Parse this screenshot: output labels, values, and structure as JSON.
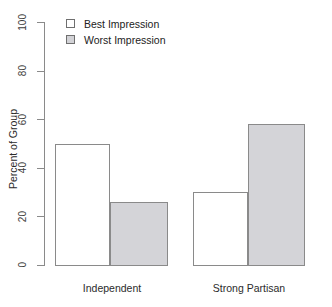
{
  "chart_data": {
    "type": "bar",
    "title": "",
    "subtitle": "",
    "xlabel": "",
    "ylabel": "Percent of Group",
    "categories": [
      "Independent",
      "Strong Partisan"
    ],
    "series": [
      {
        "name": "Best Impression",
        "values": [
          50,
          30
        ],
        "fill": "#ffffff",
        "border": "#8a8a8a"
      },
      {
        "name": "Worst Impression",
        "values": [
          26,
          58
        ],
        "fill": "#d4d4d8",
        "border": "#8a8a8a"
      }
    ],
    "ylim": [
      0,
      100
    ],
    "yticks": [
      0,
      20,
      40,
      60,
      80,
      100
    ],
    "ytick_labels": [
      "0",
      "20",
      "40",
      "60",
      "80",
      "100"
    ],
    "grid": false,
    "legend_position": "top-left",
    "axis_color": "#8a8a8a",
    "background": "#ffffff"
  },
  "legend": {
    "items": [
      {
        "label": "Best Impression",
        "style": "best"
      },
      {
        "label": "Worst Impression",
        "style": "worst"
      }
    ]
  },
  "bars": [
    {
      "name": "bar-independent-best",
      "value": 50,
      "style": "best",
      "left": 55,
      "width": 55
    },
    {
      "name": "bar-independent-worst",
      "value": 26,
      "style": "worst",
      "left": 110,
      "width": 58
    },
    {
      "name": "bar-strong-partisan-best",
      "value": 30,
      "style": "best",
      "left": 193,
      "width": 55
    },
    {
      "name": "bar-strong-partisan-worst",
      "value": 58,
      "style": "worst",
      "left": 248,
      "width": 57
    }
  ],
  "category_labels": [
    {
      "text": "Independent",
      "left": 56,
      "width": 112
    },
    {
      "text": "Strong Partisan",
      "left": 193,
      "width": 112
    }
  ]
}
